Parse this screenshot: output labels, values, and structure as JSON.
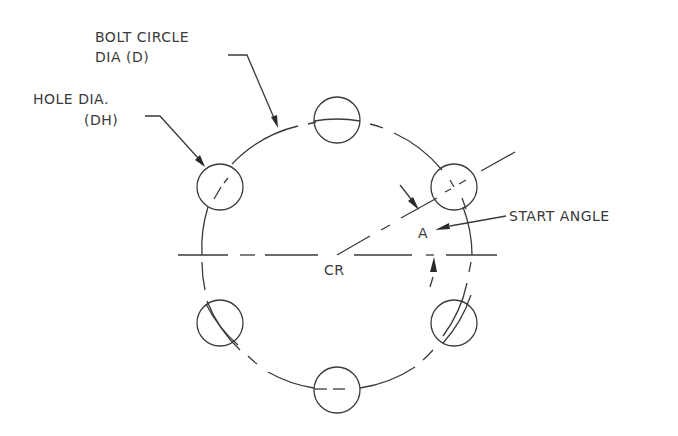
{
  "diagram": {
    "type": "bolt-circle-pattern",
    "labels": {
      "bolt_circle_line1": "BOLT CIRCLE",
      "bolt_circle_line2": "DIA (D)",
      "hole_dia_line1": "HOLE DIA.",
      "hole_dia_line2": "(DH)",
      "start_angle": "START ANGLE",
      "angle_symbol": "A",
      "center": "CR"
    },
    "geometry": {
      "center": [
        337,
        255
      ],
      "bolt_circle_radius": 135,
      "hole_radius": 23,
      "hole_count": 6,
      "hole_angles_deg": [
        30,
        90,
        150,
        210,
        270,
        330
      ],
      "start_angle_deg": 30
    },
    "colors": {
      "line": "#3a3a3a",
      "background": "#ffffff"
    }
  }
}
